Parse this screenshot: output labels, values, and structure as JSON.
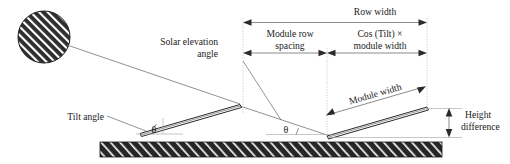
{
  "diagram": {
    "background_color": "#ffffff",
    "ground_color": "#262626",
    "labels": {
      "row_width": "Row width",
      "module_row_spacing_line1": "Module row",
      "module_row_spacing_line2": "spacing",
      "cos_tilt_line1": "Cos (Tilt) ×",
      "cos_tilt_line2": "module width",
      "module_width": "Module width",
      "height_difference_line1": "Height",
      "height_difference_line2": "difference",
      "solar_elevation_line1": "Solar elevation",
      "solar_elevation_line2": "angle",
      "tilt_angle": "Tilt angle",
      "theta_front": "θ",
      "theta_rear": "θ"
    },
    "elements": {
      "sun": "sun-hatched-circle",
      "ground": "ground-hatched-bar",
      "front_module": "front-pv-module",
      "rear_module": "rear-pv-module",
      "solar_ray": "solar-ray-line"
    },
    "colors": {
      "line": "#1a1a1a",
      "dimension": "#5a5a5a",
      "extension": "#a8a8a8",
      "ground_fill": "#262626",
      "hatch": "#ffffff"
    }
  }
}
